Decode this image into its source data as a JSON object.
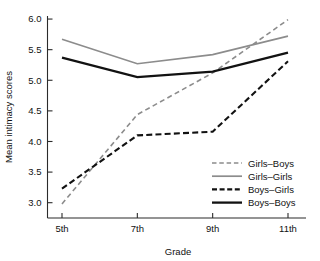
{
  "chart_data": {
    "type": "line",
    "title": "",
    "xlabel": "Grade",
    "ylabel": "Mean intimacy scores",
    "categories": [
      "5th",
      "7th",
      "9th",
      "11th"
    ],
    "xticklabels": [
      "5th",
      "7th",
      "9th",
      "11th"
    ],
    "yticklabels": [
      "3.0",
      "3.5",
      "4.0",
      "4.5",
      "5.0",
      "5.5",
      "6.0"
    ],
    "ylim": [
      2.75,
      6.05
    ],
    "ytick_values": [
      3.0,
      3.5,
      4.0,
      4.5,
      5.0,
      5.5,
      6.0
    ],
    "grid": false,
    "legend_position": "lower-right",
    "series": [
      {
        "name": "Girls–Boys",
        "values": [
          2.98,
          4.44,
          5.12,
          5.99
        ],
        "color": "#8c8c8c",
        "style": "dashed",
        "width": 1.6
      },
      {
        "name": "Girls–Girls",
        "values": [
          5.67,
          5.27,
          5.42,
          5.72
        ],
        "color": "#8c8c8c",
        "style": "solid",
        "width": 1.7
      },
      {
        "name": "Boys–Girls",
        "values": [
          3.23,
          4.1,
          4.16,
          5.31
        ],
        "color": "#121212",
        "style": "dashed",
        "width": 2.1
      },
      {
        "name": "Boys–Boys",
        "values": [
          5.37,
          5.05,
          5.14,
          5.45
        ],
        "color": "#121212",
        "style": "solid",
        "width": 2.3
      }
    ]
  },
  "legend": {
    "entries": [
      {
        "label": "Girls–Boys"
      },
      {
        "label": "Girls–Girls"
      },
      {
        "label": "Boys–Girls"
      },
      {
        "label": "Boys–Boys"
      }
    ]
  }
}
